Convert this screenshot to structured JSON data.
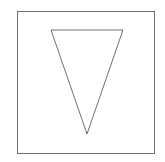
{
  "diagram": {
    "background": "#ffffff",
    "stroke_color": "#707070",
    "square": {
      "x": 17,
      "y": 11,
      "width": 137,
      "height": 142
    },
    "triangle": {
      "orientation": "inverted",
      "points": "51,30 123,30 87,134"
    }
  }
}
